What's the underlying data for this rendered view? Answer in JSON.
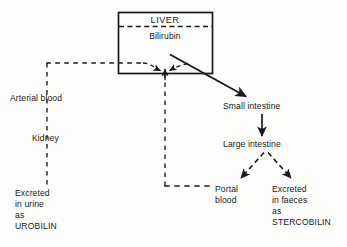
{
  "diagram": {
    "background_color": "#fdfdfb",
    "line_color": "#1a1a1a",
    "text_color": "#1a1a1a"
  },
  "liver_box": {
    "organ_label": "LIVER",
    "substance_label": "Bilirubin"
  },
  "nodes": {
    "arterial_blood": "Arterial blood",
    "kidney": "Kidney",
    "urine_excretion_line1": "Excreted",
    "urine_excretion_line2": "in urine",
    "urine_excretion_line3": "as",
    "urine_excretion_line4": "UROBILIN",
    "portal_blood_line1": "Portal",
    "portal_blood_line2": "blood",
    "small_intestine": "Small intestine",
    "large_intestine": "Large intestine",
    "faeces_excretion_line1": "Excreted",
    "faeces_excretion_line2": "in faeces",
    "faeces_excretion_line3": "as",
    "faeces_excretion_line4": "STERCOBILIN"
  },
  "edges": [
    {
      "name": "arterial-blood-to-liver",
      "style": "dashed",
      "arrow": true
    },
    {
      "name": "portal-blood-to-liver",
      "style": "dashed",
      "arrow": true
    },
    {
      "name": "liver-to-small-intestine",
      "style": "solid",
      "arrow": true
    },
    {
      "name": "small-to-large-intestine",
      "style": "solid",
      "arrow": true
    },
    {
      "name": "large-intestine-to-portal-blood",
      "style": "dashed",
      "arrow": true
    },
    {
      "name": "large-intestine-to-faeces",
      "style": "dashed",
      "arrow": true
    },
    {
      "name": "arterial-blood-to-kidney-to-urine",
      "style": "dashed",
      "arrow": false
    },
    {
      "name": "liver-divider",
      "style": "dashed",
      "arrow": false
    }
  ]
}
